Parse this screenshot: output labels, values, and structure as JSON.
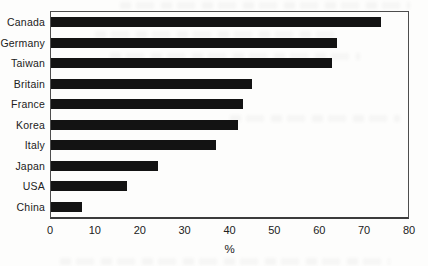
{
  "chart_data": {
    "type": "bar",
    "orientation": "horizontal",
    "categories": [
      "Canada",
      "Germany",
      "Taiwan",
      "Britain",
      "France",
      "Korea",
      "Italy",
      "Japan",
      "USA",
      "China"
    ],
    "values": [
      74,
      64,
      63,
      45,
      43,
      42,
      37,
      24,
      17,
      7
    ],
    "xlabel": "%",
    "xlim": [
      0,
      80
    ],
    "xticks": [
      0,
      10,
      20,
      30,
      40,
      50,
      60,
      70,
      80
    ],
    "grid": false,
    "bar_color": "#131313",
    "frame_color": "#4d4d4d",
    "text_color": "#212121"
  }
}
